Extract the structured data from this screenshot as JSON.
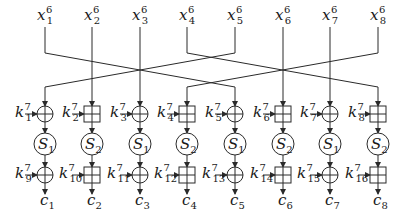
{
  "diagram": {
    "columns": [
      {
        "input": {
          "base": "x",
          "sup": "6",
          "sub": "1"
        },
        "op1": "xor",
        "k1": {
          "sup": "7",
          "sub": "1"
        },
        "sbox": {
          "base": "S",
          "sub": "1"
        },
        "op2": "xor",
        "k2": {
          "sup": "7",
          "sub": "9"
        },
        "output": {
          "base": "c",
          "sub": "1"
        },
        "from_input": 5
      },
      {
        "input": {
          "base": "x",
          "sup": "6",
          "sub": "2"
        },
        "op1": "add",
        "k1": {
          "sup": "7",
          "sub": "2"
        },
        "sbox": {
          "base": "S",
          "sub": "2"
        },
        "op2": "add",
        "k2": {
          "sup": "7",
          "sub": "10"
        },
        "output": {
          "base": "c",
          "sub": "2"
        },
        "from_input": 2
      },
      {
        "input": {
          "base": "x",
          "sup": "6",
          "sub": "3"
        },
        "op1": "xor",
        "k1": {
          "sup": "7",
          "sub": "3"
        },
        "sbox": {
          "base": "S",
          "sub": "1"
        },
        "op2": "xor",
        "k2": {
          "sup": "7",
          "sub": "11"
        },
        "output": {
          "base": "c",
          "sub": "3"
        },
        "from_input": 3
      },
      {
        "input": {
          "base": "x",
          "sup": "6",
          "sub": "4"
        },
        "op1": "add",
        "k1": {
          "sup": "7",
          "sub": "4"
        },
        "sbox": {
          "base": "S",
          "sub": "2"
        },
        "op2": "add",
        "k2": {
          "sup": "7",
          "sub": "12"
        },
        "output": {
          "base": "c",
          "sub": "4"
        },
        "from_input": 8
      },
      {
        "input": {
          "base": "x",
          "sup": "6",
          "sub": "5"
        },
        "op1": "xor",
        "k1": {
          "sup": "7",
          "sub": "5"
        },
        "sbox": {
          "base": "S",
          "sub": "1"
        },
        "op2": "xor",
        "k2": {
          "sup": "7",
          "sub": "13"
        },
        "output": {
          "base": "c",
          "sub": "5"
        },
        "from_input": 1
      },
      {
        "input": {
          "base": "x",
          "sup": "6",
          "sub": "6"
        },
        "op1": "add",
        "k1": {
          "sup": "7",
          "sub": "6"
        },
        "sbox": {
          "base": "S",
          "sub": "2"
        },
        "op2": "add",
        "k2": {
          "sup": "7",
          "sub": "14"
        },
        "output": {
          "base": "c",
          "sub": "6"
        },
        "from_input": 6
      },
      {
        "input": {
          "base": "x",
          "sup": "6",
          "sub": "7"
        },
        "op1": "xor",
        "k1": {
          "sup": "7",
          "sub": "7"
        },
        "sbox": {
          "base": "S",
          "sub": "1"
        },
        "op2": "xor",
        "k2": {
          "sup": "7",
          "sub": "15"
        },
        "output": {
          "base": "c",
          "sub": "7"
        },
        "from_input": 7
      },
      {
        "input": {
          "base": "x",
          "sup": "6",
          "sub": "8"
        },
        "op1": "add",
        "k1": {
          "sup": "7",
          "sub": "8"
        },
        "sbox": {
          "base": "S",
          "sub": "2"
        },
        "op2": "add",
        "k2": {
          "sup": "7",
          "sub": "16"
        },
        "output": {
          "base": "c",
          "sub": "8"
        },
        "from_input": 4
      }
    ],
    "key_base": "k",
    "colors": {
      "stroke": "#2a2a2a",
      "text": "#1a1a1a",
      "background": "#ffffff"
    }
  }
}
